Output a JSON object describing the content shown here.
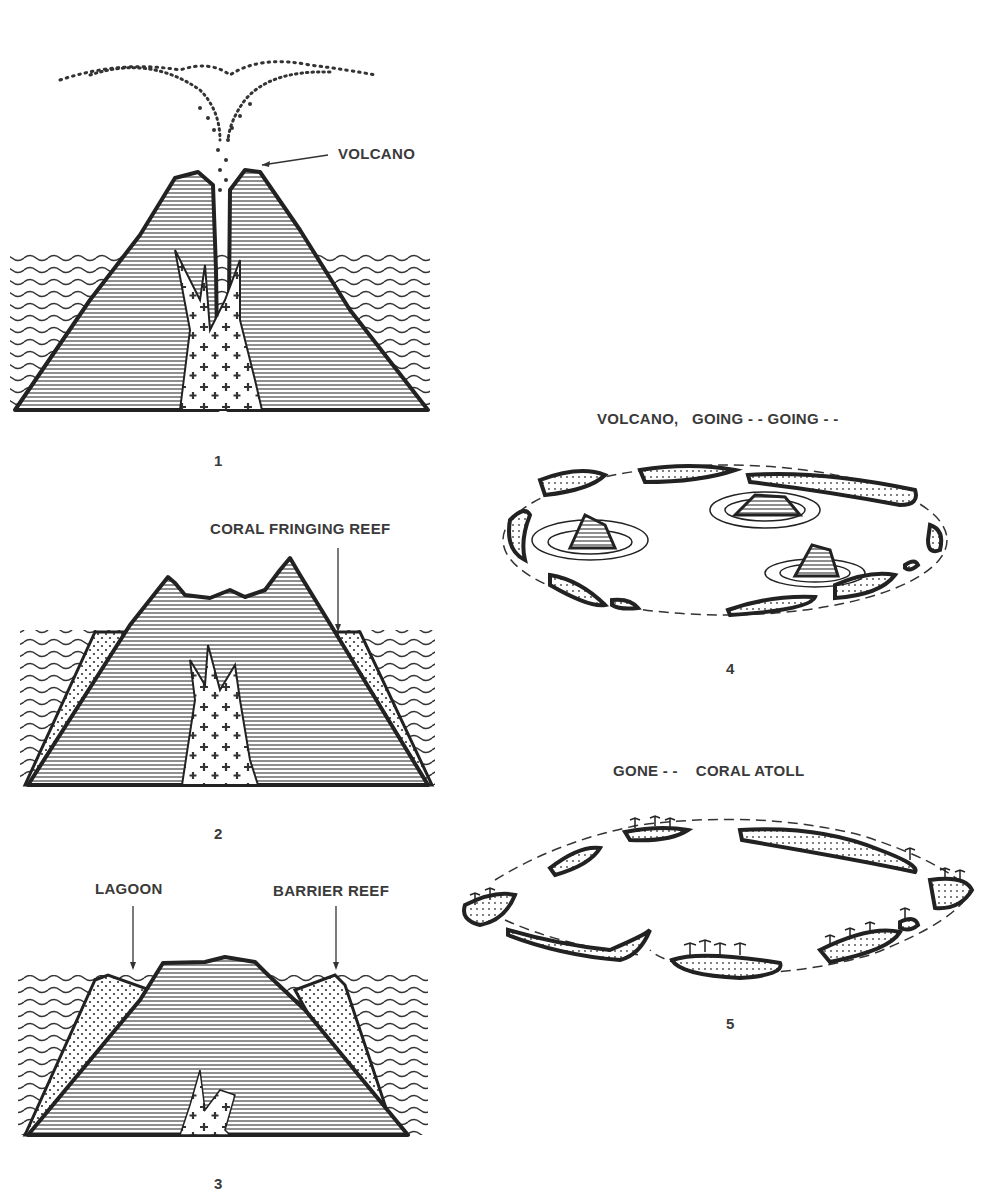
{
  "diagram": {
    "panels": [
      {
        "number": "1",
        "labels": [
          "VOLCANO"
        ]
      },
      {
        "number": "2",
        "labels": [
          "CORAL FRINGING REEF"
        ]
      },
      {
        "number": "3",
        "labels": [
          "LAGOON",
          "BARRIER REEF"
        ]
      },
      {
        "number": "4",
        "labels": [
          "VOLCANO,   GOING - - GOING - -"
        ]
      },
      {
        "number": "5",
        "labels": [
          "GONE - -    CORAL ATOLL"
        ]
      }
    ]
  }
}
